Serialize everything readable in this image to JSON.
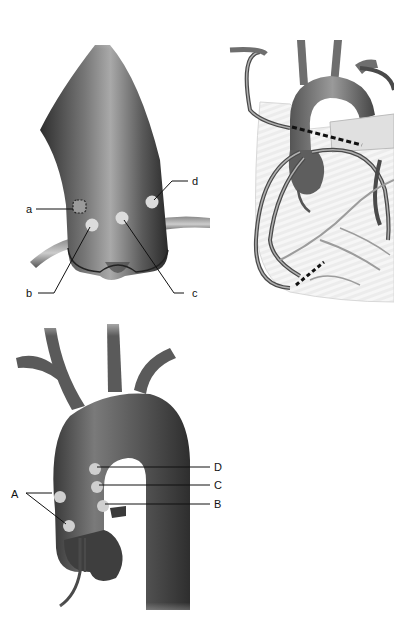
{
  "figure": {
    "panels": [
      {
        "id": "aortic-root-closeup",
        "labels": [
          "a",
          "b",
          "c",
          "d"
        ]
      },
      {
        "id": "heart-coronary-bypass",
        "labels": []
      },
      {
        "id": "aortic-arch",
        "labels": [
          "A",
          "B",
          "C",
          "D"
        ]
      }
    ]
  },
  "panel1": {
    "a": "a",
    "b": "b",
    "c": "c",
    "d": "d"
  },
  "panel3": {
    "A": "A",
    "B": "B",
    "C": "C",
    "D": "D"
  },
  "colors": {
    "vessel_dark": "#3c3c3c",
    "vessel_mid": "#6e6e6e",
    "vessel_light": "#b8b8b8",
    "marker": "#d9d9d9",
    "heart_fill": "#e9e9e9",
    "dashed": "#111111"
  }
}
